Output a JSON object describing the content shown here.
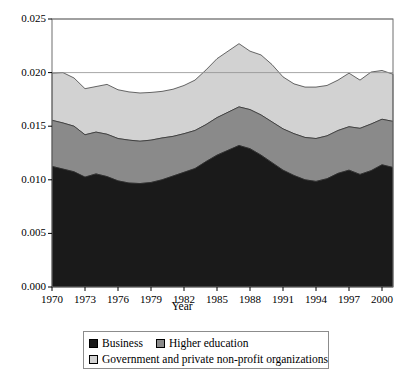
{
  "chart_data": {
    "type": "area",
    "stacked": true,
    "title": "",
    "xlabel": "Year",
    "ylabel": "",
    "xlim": [
      1970,
      2001
    ],
    "ylim": [
      0.0,
      0.025
    ],
    "grid": true,
    "gridlines_y": [
      0.02,
      0.025
    ],
    "legend_position": "bottom",
    "y_ticks": [
      0.0,
      0.005,
      0.01,
      0.015,
      0.02,
      0.025
    ],
    "y_tick_labels": [
      "0.000",
      "0.005",
      "0.010",
      "0.015",
      "0.020",
      "0.025"
    ],
    "x_ticks": [
      1970,
      1973,
      1976,
      1979,
      1982,
      1985,
      1988,
      1991,
      1994,
      1997,
      2000
    ],
    "x_tick_labels": [
      "1970",
      "1973",
      "1976",
      "1979",
      "1982",
      "1985",
      "1988",
      "1991",
      "1994",
      "1997",
      "2000"
    ],
    "x": [
      1970,
      1971,
      1972,
      1973,
      1974,
      1975,
      1976,
      1977,
      1978,
      1979,
      1980,
      1981,
      1982,
      1983,
      1984,
      1985,
      1986,
      1987,
      1988,
      1989,
      1990,
      1991,
      1992,
      1993,
      1994,
      1995,
      1996,
      1997,
      1998,
      1999,
      2000,
      2001
    ],
    "series": [
      {
        "name": "Business",
        "color": "#1a1a1a",
        "values": [
          0.01125,
          0.011,
          0.01075,
          0.01025,
          0.01055,
          0.0103,
          0.0099,
          0.0097,
          0.00965,
          0.00975,
          0.01,
          0.01035,
          0.0107,
          0.01105,
          0.0117,
          0.0123,
          0.01275,
          0.0132,
          0.0129,
          0.0123,
          0.0116,
          0.0109,
          0.0104,
          0.01,
          0.00985,
          0.0101,
          0.0106,
          0.0109,
          0.0105,
          0.01085,
          0.0114,
          0.01115
        ]
      },
      {
        "name": "Higher education",
        "color": "#8a8a8a",
        "values": [
          0.0043,
          0.0043,
          0.00425,
          0.00395,
          0.0039,
          0.00395,
          0.00395,
          0.004,
          0.00395,
          0.00395,
          0.0039,
          0.0037,
          0.0036,
          0.00355,
          0.00345,
          0.0035,
          0.00355,
          0.0036,
          0.00365,
          0.00375,
          0.0038,
          0.00385,
          0.0039,
          0.00395,
          0.004,
          0.004,
          0.004,
          0.00405,
          0.0043,
          0.00435,
          0.00425,
          0.0043
        ]
      },
      {
        "name": "Government and private non-profit organizations",
        "color": "#d2d2d2",
        "values": [
          0.0044,
          0.0047,
          0.0045,
          0.0043,
          0.00425,
          0.00465,
          0.00455,
          0.0045,
          0.0045,
          0.00445,
          0.00435,
          0.0044,
          0.0045,
          0.0047,
          0.0051,
          0.0055,
          0.0057,
          0.0059,
          0.00545,
          0.0056,
          0.00535,
          0.00485,
          0.00465,
          0.0047,
          0.0048,
          0.0047,
          0.0047,
          0.005,
          0.0045,
          0.00485,
          0.00455,
          0.0044
        ]
      }
    ],
    "totals": [
      0.01995,
      0.02,
      0.0195,
      0.0185,
      0.0187,
      0.0189,
      0.0184,
      0.0182,
      0.0181,
      0.01815,
      0.01825,
      0.01845,
      0.0188,
      0.0193,
      0.02025,
      0.0213,
      0.022,
      0.0227,
      0.022,
      0.02165,
      0.02075,
      0.0196,
      0.01895,
      0.01865,
      0.01865,
      0.0188,
      0.0193,
      0.01995,
      0.0193,
      0.02005,
      0.0202,
      0.01985
    ]
  },
  "axis": {
    "x_title": "Year"
  },
  "legend": {
    "entries": [
      {
        "label": "Business",
        "swatch": "business-swatch"
      },
      {
        "label": "Higher education",
        "swatch": "higher-education-swatch"
      },
      {
        "label": "Government and private non-profit organizations",
        "swatch": "government-swatch"
      }
    ]
  }
}
